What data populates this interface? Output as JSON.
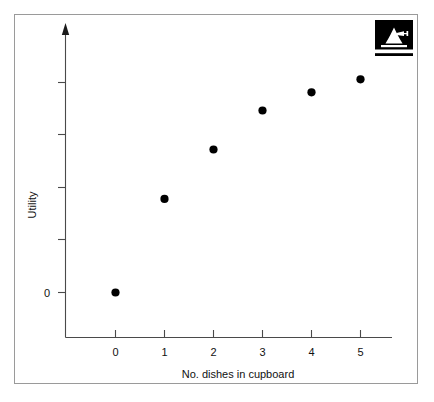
{
  "figure": {
    "background_color": "#ffffff",
    "frame_color": "#9a9a9a",
    "axis_color": "#4a4a4a",
    "marker_color": "#000000",
    "logo": {
      "name": "bell-anvil-logo",
      "background_color": "#000000",
      "mark_color": "#ffffff"
    }
  },
  "chart_data": {
    "type": "scatter",
    "title": "",
    "xlabel": "No. dishes in cupboard",
    "ylabel": "Utility",
    "x": [
      0,
      1,
      2,
      3,
      4,
      5
    ],
    "values": [
      0,
      1.8,
      2.75,
      3.5,
      3.85,
      4.1
    ],
    "series": [
      {
        "name": "Utility",
        "x": [
          0,
          1,
          2,
          3,
          4,
          5
        ],
        "values": [
          0,
          1.8,
          2.75,
          3.5,
          3.85,
          4.1
        ]
      }
    ],
    "xtick_labels": [
      "0",
      "1",
      "2",
      "3",
      "4",
      "5"
    ],
    "xtick_values": [
      0,
      1,
      2,
      3,
      4,
      5
    ],
    "ytick_labels": [
      "0",
      "",
      "",
      "",
      ""
    ],
    "ytick_values": [
      0,
      1,
      2,
      3,
      4
    ],
    "y_zero_label": "0",
    "xlim": [
      -0.45,
      5.55
    ],
    "ylim": [
      -1.1,
      5.1
    ],
    "grid": false,
    "legend": false,
    "y_axis_arrow": true
  }
}
